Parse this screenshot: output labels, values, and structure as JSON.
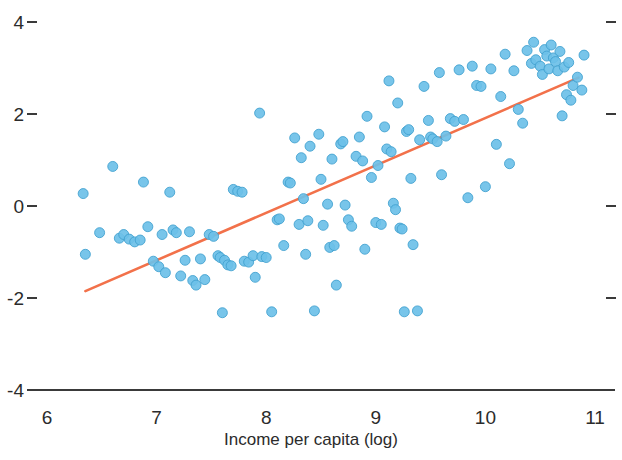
{
  "chart_data": {
    "type": "scatter",
    "title": "",
    "xlabel": "Income per capita (log)",
    "ylabel": "",
    "xlim": [
      5.8,
      11.2
    ],
    "ylim": [
      -4.4,
      4.4
    ],
    "xticks": [
      6,
      7,
      8,
      9,
      10,
      11
    ],
    "xtick_labels": [
      "6",
      "7",
      "8",
      "9",
      "10",
      "11"
    ],
    "yticks": [
      4,
      2,
      0,
      -2,
      -4
    ],
    "ytick_labels": [
      "4",
      "2",
      "0",
      "-2",
      "-4"
    ],
    "grid": false,
    "legend": null,
    "point_color": "#6DC0E8",
    "point_edge_color": "#3FA0CF",
    "point_radius": 5,
    "line_color": "#F2714A",
    "line_width": 2.6,
    "axis_color": "#3a3a3a",
    "trend_line": {
      "name": "linear fit",
      "x": [
        6.35,
        10.85
      ],
      "y": [
        -1.85,
        2.79
      ]
    },
    "series": [
      {
        "name": "countries",
        "points": [
          [
            6.33,
            0.27
          ],
          [
            6.35,
            -1.05
          ],
          [
            6.48,
            -0.58
          ],
          [
            6.6,
            0.86
          ],
          [
            6.66,
            -0.7
          ],
          [
            6.7,
            -0.62
          ],
          [
            6.75,
            -0.72
          ],
          [
            6.8,
            -0.78
          ],
          [
            6.85,
            -0.74
          ],
          [
            6.88,
            0.52
          ],
          [
            6.92,
            -0.45
          ],
          [
            6.97,
            -1.2
          ],
          [
            7.02,
            -1.32
          ],
          [
            7.05,
            -0.62
          ],
          [
            7.08,
            -1.45
          ],
          [
            7.12,
            0.3
          ],
          [
            7.15,
            -0.52
          ],
          [
            7.18,
            -0.58
          ],
          [
            7.22,
            -1.52
          ],
          [
            7.26,
            -1.18
          ],
          [
            7.3,
            -0.56
          ],
          [
            7.33,
            -1.62
          ],
          [
            7.36,
            -1.72
          ],
          [
            7.4,
            -1.15
          ],
          [
            7.44,
            -1.6
          ],
          [
            7.48,
            -0.62
          ],
          [
            7.52,
            -0.66
          ],
          [
            7.56,
            -1.08
          ],
          [
            7.58,
            -1.12
          ],
          [
            7.6,
            -2.32
          ],
          [
            7.62,
            -1.18
          ],
          [
            7.65,
            -1.28
          ],
          [
            7.68,
            -1.3
          ],
          [
            7.7,
            0.36
          ],
          [
            7.74,
            0.32
          ],
          [
            7.78,
            0.3
          ],
          [
            7.8,
            -1.2
          ],
          [
            7.84,
            -1.22
          ],
          [
            7.88,
            -1.08
          ],
          [
            7.9,
            -1.55
          ],
          [
            7.94,
            2.02
          ],
          [
            7.96,
            -1.1
          ],
          [
            8.0,
            -1.12
          ],
          [
            8.05,
            -2.3
          ],
          [
            8.1,
            -0.3
          ],
          [
            8.12,
            -0.28
          ],
          [
            8.16,
            -0.86
          ],
          [
            8.2,
            0.52
          ],
          [
            8.22,
            0.5
          ],
          [
            8.26,
            1.48
          ],
          [
            8.3,
            -0.4
          ],
          [
            8.32,
            1.05
          ],
          [
            8.34,
            0.16
          ],
          [
            8.36,
            -1.05
          ],
          [
            8.38,
            -0.32
          ],
          [
            8.4,
            1.3
          ],
          [
            8.44,
            -2.28
          ],
          [
            8.48,
            1.56
          ],
          [
            8.5,
            0.58
          ],
          [
            8.52,
            -0.42
          ],
          [
            8.56,
            0.04
          ],
          [
            8.58,
            -0.9
          ],
          [
            8.6,
            1.02
          ],
          [
            8.62,
            -0.86
          ],
          [
            8.64,
            -1.72
          ],
          [
            8.68,
            1.35
          ],
          [
            8.7,
            1.4
          ],
          [
            8.72,
            0.02
          ],
          [
            8.75,
            -0.3
          ],
          [
            8.78,
            -0.44
          ],
          [
            8.82,
            1.08
          ],
          [
            8.85,
            1.5
          ],
          [
            8.88,
            0.98
          ],
          [
            8.9,
            -0.94
          ],
          [
            8.92,
            1.95
          ],
          [
            8.96,
            0.62
          ],
          [
            9.0,
            -0.36
          ],
          [
            9.02,
            0.88
          ],
          [
            9.05,
            -0.4
          ],
          [
            9.08,
            1.72
          ],
          [
            9.1,
            1.24
          ],
          [
            9.12,
            2.72
          ],
          [
            9.14,
            1.18
          ],
          [
            9.16,
            0.06
          ],
          [
            9.18,
            -0.08
          ],
          [
            9.2,
            2.24
          ],
          [
            9.22,
            -0.48
          ],
          [
            9.24,
            -0.5
          ],
          [
            9.26,
            -2.3
          ],
          [
            9.28,
            1.62
          ],
          [
            9.3,
            1.66
          ],
          [
            9.32,
            0.6
          ],
          [
            9.34,
            -0.84
          ],
          [
            9.38,
            -2.28
          ],
          [
            9.4,
            1.44
          ],
          [
            9.44,
            2.6
          ],
          [
            9.48,
            1.86
          ],
          [
            9.5,
            1.5
          ],
          [
            9.52,
            1.46
          ],
          [
            9.56,
            1.4
          ],
          [
            9.58,
            2.9
          ],
          [
            9.6,
            0.68
          ],
          [
            9.64,
            1.52
          ],
          [
            9.68,
            1.9
          ],
          [
            9.72,
            1.84
          ],
          [
            9.76,
            2.96
          ],
          [
            9.8,
            1.88
          ],
          [
            9.84,
            0.18
          ],
          [
            9.88,
            3.04
          ],
          [
            9.92,
            2.62
          ],
          [
            9.96,
            2.6
          ],
          [
            10.0,
            0.42
          ],
          [
            10.05,
            2.98
          ],
          [
            10.1,
            1.34
          ],
          [
            10.14,
            2.38
          ],
          [
            10.18,
            3.3
          ],
          [
            10.22,
            0.92
          ],
          [
            10.26,
            2.94
          ],
          [
            10.3,
            2.1
          ],
          [
            10.34,
            1.8
          ],
          [
            10.38,
            3.38
          ],
          [
            10.42,
            3.1
          ],
          [
            10.44,
            3.56
          ],
          [
            10.46,
            3.18
          ],
          [
            10.5,
            3.04
          ],
          [
            10.52,
            2.86
          ],
          [
            10.54,
            3.4
          ],
          [
            10.56,
            3.26
          ],
          [
            10.58,
            2.98
          ],
          [
            10.6,
            3.5
          ],
          [
            10.62,
            3.22
          ],
          [
            10.64,
            3.14
          ],
          [
            10.66,
            2.94
          ],
          [
            10.68,
            3.36
          ],
          [
            10.7,
            1.96
          ],
          [
            10.72,
            3.02
          ],
          [
            10.74,
            2.42
          ],
          [
            10.76,
            3.12
          ],
          [
            10.78,
            2.3
          ],
          [
            10.8,
            2.62
          ],
          [
            10.84,
            2.8
          ],
          [
            10.88,
            2.52
          ],
          [
            10.9,
            3.28
          ]
        ]
      }
    ]
  },
  "axes": {
    "x_title": "Income per capita (log)"
  }
}
